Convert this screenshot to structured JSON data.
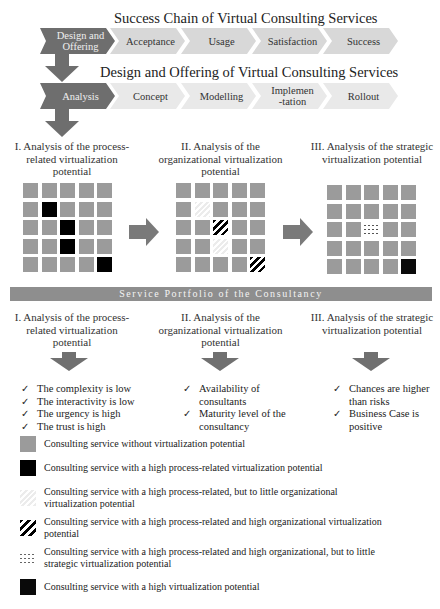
{
  "success_chain": {
    "title": "Success Chain of Virtual Consulting Services",
    "steps": [
      "Design and Offering",
      "Acceptance",
      "Usage",
      "Satisfaction",
      "Success"
    ]
  },
  "design_offering": {
    "title": "Design and Offering of Virtual Consulting Services",
    "steps": [
      "Analysis",
      "Concept",
      "Modelling",
      "Implemen-tation",
      "Rollout"
    ]
  },
  "analysis_sections": [
    {
      "label": "I. Analysis of the process-related virtualization potential"
    },
    {
      "label": "II. Analysis of the organizational virtualization potential"
    },
    {
      "label": "III. Analysis of the strategic virtualization potential"
    }
  ],
  "grids": [
    {
      "name": "process-related",
      "cells": [
        [
          "gray",
          "gray",
          "gray",
          "gray",
          "gray"
        ],
        [
          "gray",
          "black",
          "gray",
          "gray",
          "gray"
        ],
        [
          "gray",
          "gray",
          "black",
          "gray",
          "gray"
        ],
        [
          "gray",
          "gray",
          "black",
          "gray",
          "gray"
        ],
        [
          "gray",
          "gray",
          "gray",
          "gray",
          "black"
        ]
      ]
    },
    {
      "name": "organizational",
      "cells": [
        [
          "gray",
          "gray",
          "gray",
          "gray",
          "gray"
        ],
        [
          "gray",
          "faint",
          "gray",
          "gray",
          "gray"
        ],
        [
          "gray",
          "gray",
          "stripe",
          "gray",
          "gray"
        ],
        [
          "gray",
          "gray",
          "faint",
          "gray",
          "gray"
        ],
        [
          "gray",
          "gray",
          "gray",
          "gray",
          "stripe"
        ]
      ]
    },
    {
      "name": "strategic",
      "cells": [
        [
          "gray",
          "gray",
          "gray",
          "gray",
          "gray"
        ],
        [
          "gray",
          "gray",
          "gray",
          "gray",
          "gray"
        ],
        [
          "gray",
          "gray",
          "dashed",
          "gray",
          "gray"
        ],
        [
          "gray",
          "gray",
          "gray",
          "gray",
          "gray"
        ],
        [
          "gray",
          "gray",
          "gray",
          "gray",
          "dotted"
        ]
      ]
    }
  ],
  "portfolio_bar": "Service Portfolio of the Consultancy",
  "criteria": [
    {
      "heading": "I. Analysis of the process-related virtualization potential",
      "items": [
        "The complexity is low",
        "The interactivity is low",
        "The urgency is high",
        "The trust is high"
      ]
    },
    {
      "heading": "II. Analysis of the organizational virtualization potential",
      "items": [
        "Availability of consultants",
        "Maturity level of the consultancy"
      ]
    },
    {
      "heading": "III. Analysis of the strategic virtualization potential",
      "items": [
        "Chances are higher than risks",
        "Business Case is positive"
      ]
    }
  ],
  "check_symbol": "✓",
  "legend": [
    {
      "swatch": "gray",
      "text": "Consulting service without virtualization potential"
    },
    {
      "swatch": "black",
      "text": "Consulting service with a high process-related virtualization potential"
    },
    {
      "swatch": "faint",
      "text": "Consulting service with a high process-related, but to little organizational virtualization potential"
    },
    {
      "swatch": "stripe",
      "text": "Consulting service with a high process-related and high organizational virtualization potential"
    },
    {
      "swatch": "dashed",
      "text": "Consulting service with a high process-related and high organizational, but to little strategic virtualization potential"
    },
    {
      "swatch": "dotted",
      "text": "Consulting service with a high virtualization potential"
    }
  ],
  "colors": {
    "dark_chevron": "#6e6e6e",
    "light_chevron": "#d8d8d8",
    "cell_gray": "#9b9b9b",
    "bar": "#8e8e8e"
  }
}
